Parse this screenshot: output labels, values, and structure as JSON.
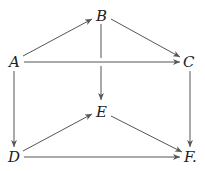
{
  "diagram": {
    "type": "commutative-diagram",
    "nodes": [
      {
        "id": "A",
        "label": "A",
        "x": 14,
        "y": 62
      },
      {
        "id": "B",
        "label": "B",
        "x": 102,
        "y": 16
      },
      {
        "id": "C",
        "label": "C",
        "x": 189,
        "y": 62
      },
      {
        "id": "D",
        "label": "D",
        "x": 14,
        "y": 157
      },
      {
        "id": "E",
        "label": "E",
        "x": 102,
        "y": 112
      },
      {
        "id": "F",
        "label": "F.",
        "x": 190,
        "y": 157
      }
    ],
    "edges": [
      {
        "from": "A",
        "to": "B"
      },
      {
        "from": "B",
        "to": "C"
      },
      {
        "from": "A",
        "to": "C"
      },
      {
        "from": "B",
        "to": "E"
      },
      {
        "from": "A",
        "to": "D"
      },
      {
        "from": "C",
        "to": "F"
      },
      {
        "from": "D",
        "to": "E"
      },
      {
        "from": "E",
        "to": "F"
      },
      {
        "from": "D",
        "to": "F"
      }
    ]
  }
}
